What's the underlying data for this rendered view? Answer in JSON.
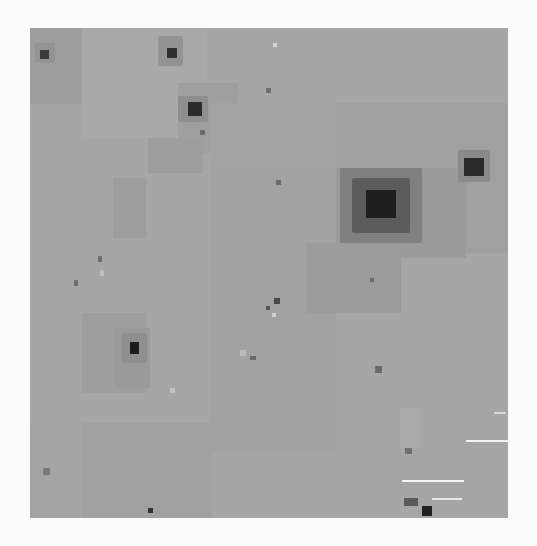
{
  "image": {
    "description": "Grayscale pixelated astronomical field image",
    "frame": {
      "left": 30,
      "top": 28,
      "width": 478,
      "height": 490,
      "background": "#a6a6a6"
    },
    "page_background": "#fbfbfb"
  },
  "patches": [
    {
      "x": 0,
      "y": 0,
      "w": 52,
      "h": 76,
      "color": "#9d9d9d"
    },
    {
      "x": 52,
      "y": 0,
      "w": 125,
      "h": 110,
      "color": "#a9a9a9"
    },
    {
      "x": 148,
      "y": 55,
      "w": 60,
      "h": 70,
      "color": "#9f9f9f"
    },
    {
      "x": 180,
      "y": 75,
      "w": 126,
      "h": 70,
      "color": "#a3a3a3"
    },
    {
      "x": 306,
      "y": 75,
      "w": 172,
      "h": 150,
      "color": "#a0a0a0"
    },
    {
      "x": 306,
      "y": 140,
      "w": 130,
      "h": 90,
      "color": "#9a9a9a"
    },
    {
      "x": 118,
      "y": 110,
      "w": 55,
      "h": 35,
      "color": "#9d9d9d"
    },
    {
      "x": 83,
      "y": 150,
      "w": 33,
      "h": 60,
      "color": "#9e9e9e"
    },
    {
      "x": 180,
      "y": 145,
      "w": 126,
      "h": 280,
      "color": "#a2a2a2"
    },
    {
      "x": 276,
      "y": 215,
      "w": 95,
      "h": 70,
      "color": "#9c9c9c"
    },
    {
      "x": 52,
      "y": 285,
      "w": 65,
      "h": 80,
      "color": "#9e9e9e"
    },
    {
      "x": 85,
      "y": 300,
      "w": 35,
      "h": 60,
      "color": "#9a9a9a"
    },
    {
      "x": 52,
      "y": 395,
      "w": 130,
      "h": 95,
      "color": "#a1a1a1"
    },
    {
      "x": 0,
      "y": 395,
      "w": 52,
      "h": 95,
      "color": "#a4a4a4"
    },
    {
      "x": 370,
      "y": 380,
      "w": 20,
      "h": 40,
      "color": "#aaaaaa"
    }
  ],
  "glows": [
    {
      "x": 310,
      "y": 140,
      "w": 82,
      "h": 75,
      "color": "#808080"
    },
    {
      "x": 322,
      "y": 150,
      "w": 58,
      "h": 55,
      "color": "#5c5c5c"
    },
    {
      "x": 428,
      "y": 122,
      "w": 32,
      "h": 32,
      "color": "#8a8a8a"
    },
    {
      "x": 148,
      "y": 68,
      "w": 30,
      "h": 26,
      "color": "#8e8e8e"
    },
    {
      "x": 128,
      "y": 8,
      "w": 25,
      "h": 30,
      "color": "#939393"
    },
    {
      "x": 92,
      "y": 305,
      "w": 25,
      "h": 30,
      "color": "#8f8f8f"
    },
    {
      "x": 5,
      "y": 15,
      "w": 20,
      "h": 20,
      "color": "#939393"
    }
  ],
  "stars": [
    {
      "name": "bright-star",
      "x": 336,
      "y": 162,
      "w": 30,
      "h": 28,
      "color": "#1e1e1e"
    },
    {
      "name": "star-right",
      "x": 434,
      "y": 130,
      "w": 20,
      "h": 18,
      "color": "#2a2a2a"
    },
    {
      "name": "star-upper-mid",
      "x": 158,
      "y": 74,
      "w": 14,
      "h": 14,
      "color": "#2b2b2b"
    },
    {
      "name": "star-top",
      "x": 137,
      "y": 20,
      "w": 10,
      "h": 10,
      "color": "#303030"
    },
    {
      "name": "star-top-left",
      "x": 10,
      "y": 22,
      "w": 9,
      "h": 9,
      "color": "#3a3a3a"
    },
    {
      "name": "star-left-mid",
      "x": 100,
      "y": 314,
      "w": 9,
      "h": 12,
      "color": "#1c1c1c"
    },
    {
      "name": "star-bottom-right",
      "x": 392,
      "y": 478,
      "w": 10,
      "h": 10,
      "color": "#222222"
    },
    {
      "name": "dot-1",
      "x": 246,
      "y": 152,
      "w": 5,
      "h": 5,
      "color": "#6a6a6a"
    },
    {
      "name": "dot-2",
      "x": 244,
      "y": 270,
      "w": 6,
      "h": 6,
      "color": "#4a4a4a"
    },
    {
      "name": "dot-3",
      "x": 236,
      "y": 278,
      "w": 4,
      "h": 4,
      "color": "#555555"
    },
    {
      "name": "dot-4",
      "x": 340,
      "y": 250,
      "w": 4,
      "h": 4,
      "color": "#6a6a6a"
    },
    {
      "name": "dot-5",
      "x": 170,
      "y": 102,
      "w": 5,
      "h": 5,
      "color": "#6a6a6a"
    },
    {
      "name": "dot-6",
      "x": 68,
      "y": 228,
      "w": 4,
      "h": 6,
      "color": "#707070"
    },
    {
      "name": "dot-7",
      "x": 44,
      "y": 252,
      "w": 4,
      "h": 6,
      "color": "#6e6e6e"
    },
    {
      "name": "dot-8",
      "x": 13,
      "y": 440,
      "w": 7,
      "h": 7,
      "color": "#7a7a7a"
    },
    {
      "name": "dot-9",
      "x": 118,
      "y": 480,
      "w": 5,
      "h": 5,
      "color": "#333333"
    },
    {
      "name": "dot-10",
      "x": 345,
      "y": 338,
      "w": 7,
      "h": 7,
      "color": "#6a6a6a"
    },
    {
      "name": "dot-11",
      "x": 375,
      "y": 420,
      "w": 7,
      "h": 6,
      "color": "#707070"
    },
    {
      "name": "dot-12",
      "x": 236,
      "y": 60,
      "w": 5,
      "h": 5,
      "color": "#6e6e6e"
    },
    {
      "name": "dot-13",
      "x": 220,
      "y": 328,
      "w": 6,
      "h": 4,
      "color": "#6a6a6a"
    },
    {
      "name": "dot-14",
      "x": 374,
      "y": 470,
      "w": 14,
      "h": 8,
      "color": "#5a5a5a"
    }
  ],
  "highlights": [
    {
      "x": 243,
      "y": 15,
      "w": 4,
      "h": 4,
      "color": "#d4d4d4"
    },
    {
      "x": 210,
      "y": 322,
      "w": 6,
      "h": 6,
      "color": "#bcbcbc"
    },
    {
      "x": 242,
      "y": 285,
      "w": 4,
      "h": 4,
      "color": "#d0d0d0"
    },
    {
      "x": 70,
      "y": 242,
      "w": 4,
      "h": 6,
      "color": "#c0c0c0"
    },
    {
      "x": 140,
      "y": 360,
      "w": 5,
      "h": 5,
      "color": "#c4c4c4"
    }
  ],
  "streaks": [
    {
      "x": 436,
      "y": 412,
      "w": 42,
      "color": "#f2f2f2"
    },
    {
      "x": 372,
      "y": 452,
      "w": 62,
      "color": "#f4f4f4"
    },
    {
      "x": 402,
      "y": 470,
      "w": 30,
      "color": "#e6e6e6"
    },
    {
      "x": 464,
      "y": 384,
      "w": 12,
      "color": "#d8d8d8"
    }
  ]
}
